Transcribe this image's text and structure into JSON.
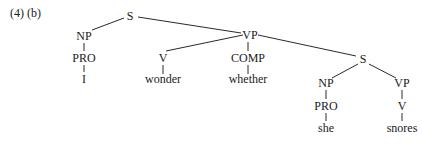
{
  "caption": "(4) (b)",
  "tree": {
    "nodes": [
      {
        "id": "S1",
        "label": "S",
        "x": 130,
        "y": 10
      },
      {
        "id": "NP1",
        "label": "NP",
        "x": 84,
        "y": 30
      },
      {
        "id": "PRO1",
        "label": "PRO",
        "x": 84,
        "y": 52
      },
      {
        "id": "I",
        "label": "I",
        "x": 84,
        "y": 73
      },
      {
        "id": "VP1",
        "label": "VP",
        "x": 250,
        "y": 29
      },
      {
        "id": "V1",
        "label": "V",
        "x": 163,
        "y": 52
      },
      {
        "id": "wonder",
        "label": "wonder",
        "x": 163,
        "y": 73
      },
      {
        "id": "COMP",
        "label": "COMP",
        "x": 248,
        "y": 52
      },
      {
        "id": "whether",
        "label": "whether",
        "x": 248,
        "y": 73
      },
      {
        "id": "S2",
        "label": "S",
        "x": 363,
        "y": 53
      },
      {
        "id": "NP2",
        "label": "NP",
        "x": 326,
        "y": 77
      },
      {
        "id": "PRO2",
        "label": "PRO",
        "x": 326,
        "y": 100
      },
      {
        "id": "she",
        "label": "she",
        "x": 326,
        "y": 122
      },
      {
        "id": "VP2",
        "label": "VP",
        "x": 402,
        "y": 77
      },
      {
        "id": "V2",
        "label": "V",
        "x": 402,
        "y": 100
      },
      {
        "id": "snores",
        "label": "snores",
        "x": 402,
        "y": 122
      }
    ],
    "edges": [
      {
        "from": "S1",
        "to": "NP1",
        "x1": 124,
        "y1": 18,
        "x2": 92,
        "y2": 30
      },
      {
        "from": "S1",
        "to": "VP1",
        "x1": 138,
        "y1": 17,
        "x2": 241,
        "y2": 33
      },
      {
        "from": "NP1",
        "to": "PRO1",
        "x1": 84,
        "y1": 43,
        "x2": 84,
        "y2": 51
      },
      {
        "from": "PRO1",
        "to": "I",
        "x1": 84,
        "y1": 65,
        "x2": 84,
        "y2": 72
      },
      {
        "from": "VP1",
        "to": "V1",
        "x1": 243,
        "y1": 35,
        "x2": 166,
        "y2": 51
      },
      {
        "from": "VP1",
        "to": "COMP",
        "x1": 248,
        "y1": 42,
        "x2": 248,
        "y2": 51
      },
      {
        "from": "VP1",
        "to": "S2",
        "x1": 258,
        "y1": 35,
        "x2": 356,
        "y2": 56
      },
      {
        "from": "V1",
        "to": "wonder",
        "x1": 163,
        "y1": 65,
        "x2": 163,
        "y2": 74
      },
      {
        "from": "COMP",
        "to": "whether",
        "x1": 248,
        "y1": 65,
        "x2": 248,
        "y2": 74
      },
      {
        "from": "S2",
        "to": "NP2",
        "x1": 358,
        "y1": 64,
        "x2": 332,
        "y2": 78
      },
      {
        "from": "S2",
        "to": "VP2",
        "x1": 369,
        "y1": 64,
        "x2": 396,
        "y2": 78
      },
      {
        "from": "NP2",
        "to": "PRO2",
        "x1": 326,
        "y1": 90,
        "x2": 326,
        "y2": 99
      },
      {
        "from": "PRO2",
        "to": "she",
        "x1": 326,
        "y1": 113,
        "x2": 326,
        "y2": 121
      },
      {
        "from": "VP2",
        "to": "V2",
        "x1": 402,
        "y1": 90,
        "x2": 402,
        "y2": 99
      },
      {
        "from": "V2",
        "to": "snores",
        "x1": 402,
        "y1": 113,
        "x2": 402,
        "y2": 121
      }
    ]
  }
}
